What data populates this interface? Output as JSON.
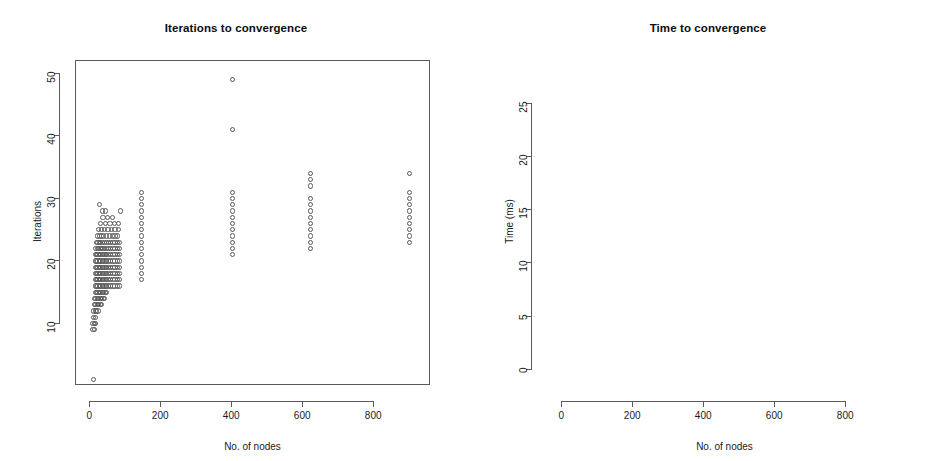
{
  "figure": {
    "background": "#ffffff",
    "point_color": "#585858",
    "axis_color": "#5a5a5a",
    "panel_count": 2
  },
  "chart_data": [
    {
      "type": "scatter",
      "panel": "left",
      "title": "Iterations to convergence",
      "xlabel": "No. of nodes",
      "ylabel": "Iterations",
      "xlim": [
        -40,
        960
      ],
      "ylim": [
        0,
        52
      ],
      "xticks": [
        0,
        200,
        400,
        600,
        800
      ],
      "yticks": [
        10,
        20,
        30,
        40,
        50
      ],
      "grid": false,
      "legend": "none",
      "marker": "open-circle",
      "points": [
        [
          10,
          1
        ],
        [
          8,
          9
        ],
        [
          12,
          9
        ],
        [
          8,
          10
        ],
        [
          12,
          10
        ],
        [
          16,
          10
        ],
        [
          10,
          11
        ],
        [
          14,
          11
        ],
        [
          10,
          12
        ],
        [
          14,
          12
        ],
        [
          18,
          12
        ],
        [
          22,
          12
        ],
        [
          12,
          13
        ],
        [
          16,
          13
        ],
        [
          20,
          13
        ],
        [
          24,
          13
        ],
        [
          28,
          13
        ],
        [
          32,
          13
        ],
        [
          12,
          14
        ],
        [
          16,
          14
        ],
        [
          20,
          14
        ],
        [
          24,
          14
        ],
        [
          28,
          14
        ],
        [
          32,
          14
        ],
        [
          36,
          14
        ],
        [
          40,
          14
        ],
        [
          14,
          15
        ],
        [
          18,
          15
        ],
        [
          22,
          15
        ],
        [
          26,
          15
        ],
        [
          30,
          15
        ],
        [
          34,
          15
        ],
        [
          38,
          15
        ],
        [
          42,
          15
        ],
        [
          46,
          15
        ],
        [
          14,
          16
        ],
        [
          18,
          16
        ],
        [
          22,
          16
        ],
        [
          26,
          16
        ],
        [
          30,
          16
        ],
        [
          34,
          16
        ],
        [
          38,
          16
        ],
        [
          42,
          16
        ],
        [
          46,
          16
        ],
        [
          52,
          16
        ],
        [
          58,
          16
        ],
        [
          64,
          16
        ],
        [
          70,
          16
        ],
        [
          76,
          16
        ],
        [
          82,
          16
        ],
        [
          14,
          17
        ],
        [
          18,
          17
        ],
        [
          22,
          17
        ],
        [
          26,
          17
        ],
        [
          30,
          17
        ],
        [
          34,
          17
        ],
        [
          38,
          17
        ],
        [
          42,
          17
        ],
        [
          46,
          17
        ],
        [
          52,
          17
        ],
        [
          58,
          17
        ],
        [
          64,
          17
        ],
        [
          70,
          17
        ],
        [
          76,
          17
        ],
        [
          82,
          17
        ],
        [
          14,
          18
        ],
        [
          18,
          18
        ],
        [
          22,
          18
        ],
        [
          26,
          18
        ],
        [
          30,
          18
        ],
        [
          34,
          18
        ],
        [
          38,
          18
        ],
        [
          42,
          18
        ],
        [
          46,
          18
        ],
        [
          52,
          18
        ],
        [
          58,
          18
        ],
        [
          64,
          18
        ],
        [
          70,
          18
        ],
        [
          76,
          18
        ],
        [
          82,
          18
        ],
        [
          14,
          19
        ],
        [
          18,
          19
        ],
        [
          22,
          19
        ],
        [
          26,
          19
        ],
        [
          30,
          19
        ],
        [
          34,
          19
        ],
        [
          38,
          19
        ],
        [
          42,
          19
        ],
        [
          46,
          19
        ],
        [
          52,
          19
        ],
        [
          58,
          19
        ],
        [
          64,
          19
        ],
        [
          70,
          19
        ],
        [
          76,
          19
        ],
        [
          82,
          19
        ],
        [
          14,
          20
        ],
        [
          18,
          20
        ],
        [
          22,
          20
        ],
        [
          26,
          20
        ],
        [
          30,
          20
        ],
        [
          34,
          20
        ],
        [
          38,
          20
        ],
        [
          42,
          20
        ],
        [
          46,
          20
        ],
        [
          52,
          20
        ],
        [
          58,
          20
        ],
        [
          64,
          20
        ],
        [
          70,
          20
        ],
        [
          76,
          20
        ],
        [
          82,
          20
        ],
        [
          14,
          21
        ],
        [
          18,
          21
        ],
        [
          22,
          21
        ],
        [
          26,
          21
        ],
        [
          30,
          21
        ],
        [
          34,
          21
        ],
        [
          38,
          21
        ],
        [
          42,
          21
        ],
        [
          46,
          21
        ],
        [
          52,
          21
        ],
        [
          58,
          21
        ],
        [
          64,
          21
        ],
        [
          70,
          21
        ],
        [
          76,
          21
        ],
        [
          82,
          21
        ],
        [
          16,
          22
        ],
        [
          20,
          22
        ],
        [
          24,
          22
        ],
        [
          28,
          22
        ],
        [
          32,
          22
        ],
        [
          36,
          22
        ],
        [
          40,
          22
        ],
        [
          46,
          22
        ],
        [
          52,
          22
        ],
        [
          58,
          22
        ],
        [
          64,
          22
        ],
        [
          70,
          22
        ],
        [
          76,
          22
        ],
        [
          82,
          22
        ],
        [
          18,
          23
        ],
        [
          22,
          23
        ],
        [
          26,
          23
        ],
        [
          30,
          23
        ],
        [
          34,
          23
        ],
        [
          40,
          23
        ],
        [
          46,
          23
        ],
        [
          52,
          23
        ],
        [
          58,
          23
        ],
        [
          64,
          23
        ],
        [
          70,
          23
        ],
        [
          76,
          23
        ],
        [
          82,
          23
        ],
        [
          20,
          24
        ],
        [
          26,
          24
        ],
        [
          32,
          24
        ],
        [
          38,
          24
        ],
        [
          46,
          24
        ],
        [
          54,
          24
        ],
        [
          62,
          24
        ],
        [
          70,
          24
        ],
        [
          78,
          24
        ],
        [
          24,
          25
        ],
        [
          32,
          25
        ],
        [
          40,
          25
        ],
        [
          50,
          25
        ],
        [
          60,
          25
        ],
        [
          70,
          25
        ],
        [
          80,
          25
        ],
        [
          30,
          26
        ],
        [
          42,
          26
        ],
        [
          56,
          26
        ],
        [
          68,
          26
        ],
        [
          80,
          26
        ],
        [
          36,
          27
        ],
        [
          48,
          27
        ],
        [
          62,
          27
        ],
        [
          34,
          28
        ],
        [
          44,
          28
        ],
        [
          86,
          28
        ],
        [
          26,
          29
        ],
        [
          145,
          17
        ],
        [
          145,
          18
        ],
        [
          145,
          19
        ],
        [
          145,
          20
        ],
        [
          145,
          21
        ],
        [
          145,
          22
        ],
        [
          145,
          23
        ],
        [
          145,
          24
        ],
        [
          145,
          25
        ],
        [
          145,
          26
        ],
        [
          145,
          27
        ],
        [
          145,
          28
        ],
        [
          145,
          29
        ],
        [
          145,
          30
        ],
        [
          145,
          31
        ],
        [
          400,
          21
        ],
        [
          400,
          22
        ],
        [
          400,
          23
        ],
        [
          400,
          24
        ],
        [
          400,
          25
        ],
        [
          400,
          26
        ],
        [
          400,
          27
        ],
        [
          400,
          28
        ],
        [
          400,
          29
        ],
        [
          400,
          30
        ],
        [
          400,
          31
        ],
        [
          400,
          41
        ],
        [
          400,
          49
        ],
        [
          620,
          22
        ],
        [
          620,
          23
        ],
        [
          620,
          24
        ],
        [
          620,
          25
        ],
        [
          620,
          26
        ],
        [
          620,
          27
        ],
        [
          620,
          28
        ],
        [
          620,
          29
        ],
        [
          620,
          30
        ],
        [
          620,
          32
        ],
        [
          620,
          33
        ],
        [
          620,
          34
        ],
        [
          900,
          23
        ],
        [
          900,
          24
        ],
        [
          900,
          25
        ],
        [
          900,
          26
        ],
        [
          900,
          27
        ],
        [
          900,
          28
        ],
        [
          900,
          29
        ],
        [
          900,
          30
        ],
        [
          900,
          31
        ],
        [
          900,
          34
        ]
      ]
    },
    {
      "type": "scatter",
      "panel": "right",
      "title": "Time to convergence",
      "xlabel": "No. of nodes",
      "ylabel": "Time (ms)",
      "xlim": [
        -40,
        960
      ],
      "ylim": [
        -1.5,
        29
      ],
      "xticks": [
        0,
        200,
        400,
        600,
        800
      ],
      "yticks": [
        0,
        5,
        10,
        15,
        20,
        25
      ],
      "grid": false,
      "legend": "none",
      "marker": "open-circle",
      "points": [
        [
          8,
          0
        ],
        [
          14,
          0
        ],
        [
          20,
          0
        ],
        [
          26,
          0
        ],
        [
          32,
          0
        ],
        [
          38,
          0
        ],
        [
          46,
          0
        ],
        [
          56,
          0
        ],
        [
          66,
          0
        ],
        [
          78,
          0
        ],
        [
          8,
          1
        ],
        [
          14,
          1
        ],
        [
          20,
          1
        ],
        [
          26,
          1
        ],
        [
          32,
          1
        ],
        [
          38,
          1
        ],
        [
          46,
          1
        ],
        [
          56,
          1
        ],
        [
          66,
          1
        ],
        [
          78,
          1
        ],
        [
          145,
          0
        ],
        [
          145,
          1
        ],
        [
          145,
          2
        ],
        [
          145,
          12
        ],
        [
          145,
          28
        ],
        [
          400,
          1
        ],
        [
          400,
          2
        ],
        [
          400,
          3
        ],
        [
          400,
          4
        ],
        [
          400,
          5
        ],
        [
          620,
          2
        ],
        [
          620,
          3
        ],
        [
          620,
          4
        ],
        [
          620,
          5
        ],
        [
          620,
          6
        ],
        [
          900,
          4
        ],
        [
          900,
          5
        ],
        [
          900,
          6
        ],
        [
          900,
          12
        ],
        [
          900,
          13
        ]
      ]
    }
  ]
}
